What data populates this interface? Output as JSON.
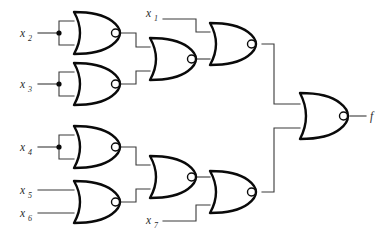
{
  "diagram": {
    "background_color": "#ffffff",
    "wire_color": "#3a3a3a",
    "gate_outline_color": "#0a0a0a",
    "gate_fill_color": "#ffffff"
  },
  "inputs": [
    {
      "id": "x2",
      "base": "x",
      "sub": "2",
      "label": "x2",
      "x": 24,
      "y": 33
    },
    {
      "id": "x3",
      "base": "x",
      "sub": "3",
      "label": "x3",
      "x": 24,
      "y": 84
    },
    {
      "id": "x1",
      "base": "x",
      "sub": "1",
      "label": "x1",
      "x": 150,
      "y": 14
    },
    {
      "id": "x4",
      "base": "x",
      "sub": "4",
      "label": "x4",
      "x": 24,
      "y": 147
    },
    {
      "id": "x5",
      "base": "x",
      "sub": "5",
      "label": "x5",
      "x": 24,
      "y": 190
    },
    {
      "id": "x6",
      "base": "x",
      "sub": "6",
      "label": "x6",
      "x": 24,
      "y": 213
    },
    {
      "id": "x7",
      "base": "x",
      "sub": "7",
      "label": "x7",
      "x": 150,
      "y": 220
    }
  ],
  "output": {
    "id": "f",
    "base": "f",
    "sub": "",
    "label": "f",
    "x": 358,
    "y": 116
  },
  "gates": [
    {
      "id": "g1",
      "type": "NOR",
      "name": "nor-gate-x2",
      "inputs": [
        "x2",
        "x2"
      ],
      "cx": 72,
      "cy": 33
    },
    {
      "id": "g2",
      "type": "NOR",
      "name": "nor-gate-x3",
      "inputs": [
        "x3",
        "x3"
      ],
      "cx": 72,
      "cy": 84
    },
    {
      "id": "g3",
      "type": "NOR",
      "name": "nor-gate-mid-upper",
      "inputs": [
        "g1",
        "g2"
      ],
      "cx": 148,
      "cy": 59
    },
    {
      "id": "g4",
      "type": "NOR",
      "name": "nor-gate-upper-right",
      "inputs": [
        "x1",
        "g3"
      ],
      "cx": 208,
      "cy": 44
    },
    {
      "id": "g5",
      "type": "NOR",
      "name": "nor-gate-x4",
      "inputs": [
        "x4",
        "x4"
      ],
      "cx": 72,
      "cy": 147
    },
    {
      "id": "g6",
      "type": "NOR",
      "name": "nor-gate-x5-x6",
      "inputs": [
        "x5",
        "x6"
      ],
      "cx": 72,
      "cy": 202
    },
    {
      "id": "g7",
      "type": "NOR",
      "name": "nor-gate-mid-lower",
      "inputs": [
        "g5",
        "g6"
      ],
      "cx": 148,
      "cy": 177
    },
    {
      "id": "g8",
      "type": "NOR",
      "name": "nor-gate-lower-right",
      "inputs": [
        "g7",
        "x7"
      ],
      "cx": 208,
      "cy": 192
    },
    {
      "id": "g9",
      "type": "NOR",
      "name": "nor-gate-output",
      "inputs": [
        "g4",
        "g8"
      ],
      "cx": 298,
      "cy": 116
    }
  ],
  "junctions": [
    {
      "id": "j-x2",
      "name": "junction-x2",
      "x": 59,
      "y": 33
    },
    {
      "id": "j-x3",
      "name": "junction-x3",
      "x": 59,
      "y": 84
    },
    {
      "id": "j-x4",
      "name": "junction-x4",
      "x": 59,
      "y": 147
    }
  ]
}
